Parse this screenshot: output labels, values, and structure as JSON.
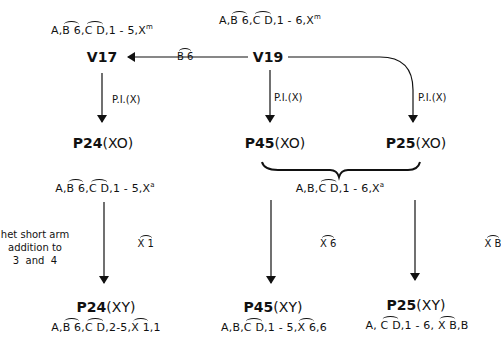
{
  "nodes": {
    "v17": "V17",
    "v19": "V19",
    "p24_xo": "P24",
    "p24_xo_suffix": "(XO)",
    "p45_xo": "P45",
    "p45_xo_suffix": "(XO)",
    "p25_xo": "P25",
    "p25_xo_suffix": "(XO)",
    "p24_xy": "P24",
    "p24_xy_suffix": "(XY)",
    "p45_xy": "P45",
    "p45_xy_suffix": "(XY)",
    "p25_xy": "P25",
    "p25_xy_suffix": "(XY)"
  },
  "karyotypes": {
    "v17": {
      "pre": "A,",
      "arc1": "B 6",
      "mid": ",",
      "arc2": "C D",
      "post": ",1 - 5,X",
      "sup": "m"
    },
    "v19": {
      "pre": "A,",
      "arc1": "B 6",
      "mid": ",",
      "arc2": "C D",
      "post": ",1 - 6,X",
      "sup": "m"
    },
    "p24_xo": {
      "pre": "A,",
      "arc1": "B 6",
      "mid": ",",
      "arc2": "C D",
      "post": ",1 - 5,X",
      "sup": "a"
    },
    "p45_p25_xo": {
      "pre": "A,B,",
      "arc1": "C D",
      "post": ",1 - 6,X",
      "sup": "a"
    },
    "p24_xy": {
      "pre": "A,",
      "arc1": "B 6",
      "mid": ",",
      "arc2": "C D",
      "mid2": ",2-5,",
      "arc3": "X 1",
      "post": ",1"
    },
    "p45_xy": {
      "pre": "A,B,",
      "arc1": "C D",
      "mid": ",1 - 5,",
      "arc2": "X 6",
      "post": ",6"
    },
    "p25_xy": {
      "pre": "A, ",
      "arc1": "C D",
      "mid": ",1 - 6, ",
      "arc2": "X B",
      "post": ",B"
    }
  },
  "edge_labels": {
    "v19_to_v17": "B 6",
    "v17_to_p24": "P.I.(X)",
    "v19_to_p45": "P.I.(X)",
    "v19_to_p25": "P.I.(X)",
    "p24_step": "X 1",
    "p45_step": "X 6",
    "p25_step": "X B"
  },
  "notes": {
    "het_line1": "het short arm",
    "het_line2": "addition to",
    "het_line3": "3  and  4"
  }
}
